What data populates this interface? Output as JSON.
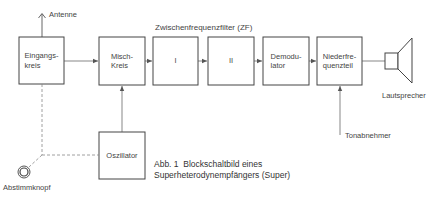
{
  "diagram": {
    "caption_line1": "Abb. 1  Blockschaltbild eines",
    "caption_line2": "Superheterodynempfängers (Super)",
    "group_label": "Zwischenfrequenzfilter (ZF)",
    "blocks": [
      {
        "id": "eingangskreis",
        "label_line1": "Eingangs-",
        "label_line2": "kreis"
      },
      {
        "id": "mischkreis",
        "label_line1": "Misch-",
        "label_line2": "Kreis"
      },
      {
        "id": "zf1",
        "label_line1": "I",
        "label_line2": ""
      },
      {
        "id": "zf2",
        "label_line1": "II",
        "label_line2": ""
      },
      {
        "id": "demodulator",
        "label_line1": "Demodu-",
        "label_line2": "lator"
      },
      {
        "id": "niederfrequenzteil",
        "label_line1": "Niederfre-",
        "label_line2": "quenzteil"
      },
      {
        "id": "oszillator",
        "label_line1": "Oszillator",
        "label_line2": ""
      }
    ],
    "external": {
      "antenne": "Antenne",
      "lautsprecher": "Lautsprecher",
      "tonabnehmer": "Tonabnehmer",
      "abstimmknopf": "Abstimmknopf"
    },
    "connections": [
      {
        "from": "Antenne",
        "to": "Eingangskreis",
        "style": "solid"
      },
      {
        "from": "Eingangskreis",
        "to": "Misch-Kreis",
        "style": "arrow"
      },
      {
        "from": "Misch-Kreis",
        "to": "I",
        "style": "arrow"
      },
      {
        "from": "I",
        "to": "II",
        "style": "arrow"
      },
      {
        "from": "II",
        "to": "Demodulator",
        "style": "arrow"
      },
      {
        "from": "Demodulator",
        "to": "Niederfrequenzteil",
        "style": "arrow"
      },
      {
        "from": "Niederfrequenzteil",
        "to": "Lautsprecher",
        "style": "solid"
      },
      {
        "from": "Oszillator",
        "to": "Misch-Kreis",
        "style": "arrow"
      },
      {
        "from": "Tonabnehmer",
        "to": "Niederfrequenzteil",
        "style": "arrow"
      },
      {
        "from": "Abstimmknopf",
        "to": "Eingangskreis",
        "style": "dashed"
      },
      {
        "from": "Abstimmknopf",
        "to": "Oszillator",
        "style": "dashed"
      }
    ],
    "colors": {
      "line": "#555555",
      "dashed": "#888888",
      "text": "#444444"
    }
  }
}
